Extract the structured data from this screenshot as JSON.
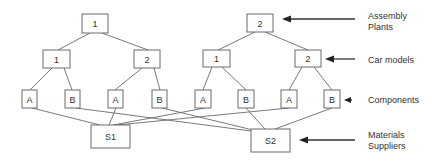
{
  "diagram": {
    "type": "supply-chain-hierarchy",
    "levels": [
      {
        "id": "plants",
        "label_line1": "Assembly",
        "label_line2": "Plants"
      },
      {
        "id": "models",
        "label_line1": "Car models"
      },
      {
        "id": "components",
        "label_line1": "Components"
      },
      {
        "id": "suppliers",
        "label_line1": "Materials",
        "label_line2": "Suppliers"
      }
    ],
    "plants": [
      {
        "label": "1"
      },
      {
        "label": "2"
      }
    ],
    "models": [
      {
        "label": "1",
        "plant": 0
      },
      {
        "label": "2",
        "plant": 0
      },
      {
        "label": "1",
        "plant": 1
      },
      {
        "label": "2",
        "plant": 1
      }
    ],
    "components": [
      {
        "label": "A",
        "model": 0,
        "supplier": 0
      },
      {
        "label": "B",
        "model": 0,
        "supplier": 1
      },
      {
        "label": "A",
        "model": 1,
        "supplier": 0
      },
      {
        "label": "B",
        "model": 1,
        "supplier": 1
      },
      {
        "label": "A",
        "model": 2,
        "supplier": 0
      },
      {
        "label": "B",
        "model": 2,
        "supplier": 1
      },
      {
        "label": "A",
        "model": 3,
        "supplier": 0
      },
      {
        "label": "B",
        "model": 3,
        "supplier": 1
      }
    ],
    "suppliers": [
      {
        "label": "S1"
      },
      {
        "label": "S2"
      }
    ]
  }
}
